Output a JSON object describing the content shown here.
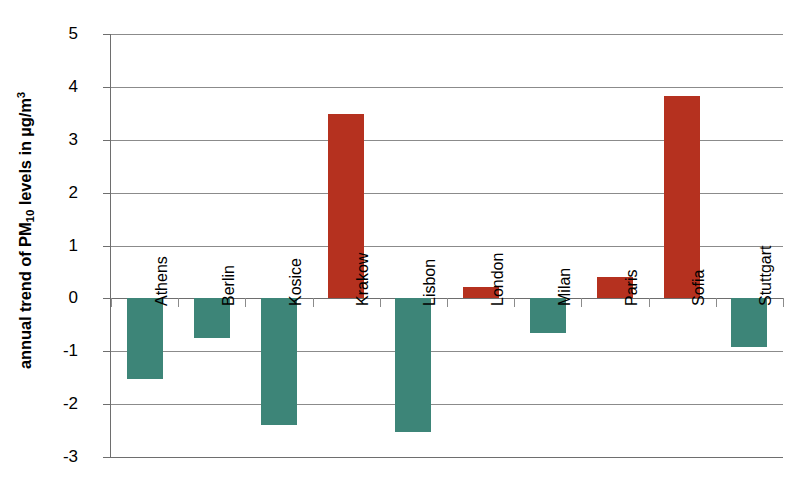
{
  "chart_data": {
    "type": "bar",
    "title": "",
    "xlabel": "",
    "ylabel": "annual trend of PM10 levels in µg/m3",
    "ylabel_parts": {
      "prefix": "annual trend of PM",
      "subscript": "10",
      "middle": " levels in µg/m",
      "superscript": "3"
    },
    "categories": [
      "Athens",
      "Berlin",
      "Kosice",
      "Krakow",
      "Lisbon",
      "London",
      "Milan",
      "Paris",
      "Sofia",
      "Stuttgart"
    ],
    "values": [
      -1.53,
      -0.74,
      -2.4,
      3.48,
      -2.53,
      0.22,
      -0.66,
      0.4,
      3.83,
      -0.92
    ],
    "ylim": [
      -3,
      5
    ],
    "ytick_labels": [
      "5",
      "4",
      "3",
      "2",
      "1",
      "0",
      "-1",
      "-2",
      "-3"
    ],
    "ytick_values": [
      5,
      4,
      3,
      2,
      1,
      0,
      -1,
      -2,
      -3
    ],
    "grid": true,
    "legend": "none",
    "colors": {
      "positive": "#b5311f",
      "negative": "#3d8578",
      "grid": "#8b8b8b",
      "axis": "#6e6e6e",
      "background": "#ffffff",
      "text": "#000000"
    }
  }
}
